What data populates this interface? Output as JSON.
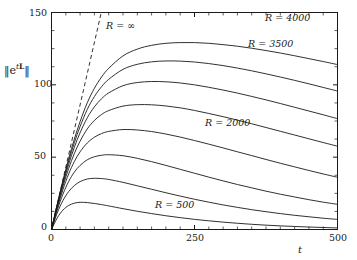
{
  "chart_data": {
    "type": "line",
    "title": "",
    "subtitle": "",
    "xlabel": "t",
    "ylabel_plain": "||e^{tL}||",
    "xlim": [
      0,
      500
    ],
    "ylim": [
      0,
      150
    ],
    "xticks": [
      0,
      250,
      500
    ],
    "xtick_labels": [
      "0",
      "250",
      "500"
    ],
    "yticks": [
      0,
      50,
      100,
      150
    ],
    "ytick_labels": [
      "0",
      "50",
      "100",
      "150"
    ],
    "x_minor_tick_step": 25,
    "y_minor_tick_step": 12.5,
    "grid": false,
    "legend_position": "inline-annotations",
    "x_sample": [
      0,
      10,
      20,
      30,
      40,
      50,
      62.5,
      75,
      87.5,
      100,
      125,
      150,
      175,
      200,
      225,
      250,
      275,
      300,
      325,
      350,
      375,
      400,
      425,
      450,
      475,
      500
    ],
    "series": [
      {
        "name": "R = 500",
        "label": "R = 500",
        "values": [
          0,
          8.0,
          13.4,
          16.6,
          18.2,
          18.8,
          18.6,
          18.0,
          17.2,
          16.3,
          14.4,
          12.6,
          11.0,
          9.5,
          8.2,
          7.0,
          6.0,
          5.1,
          4.3,
          3.6,
          3.0,
          2.5,
          2.1,
          1.7,
          1.4,
          1.1
        ]
      },
      {
        "name": "R = 1000",
        "label": "",
        "values": [
          0,
          11.4,
          20.0,
          26.2,
          30.4,
          33.1,
          34.9,
          35.4,
          35.2,
          34.6,
          32.6,
          30.2,
          27.8,
          25.4,
          23.1,
          20.9,
          18.9,
          17.0,
          15.3,
          13.7,
          12.3,
          11.0,
          9.8,
          8.8,
          7.8,
          7.0
        ]
      },
      {
        "name": "R = 1500",
        "label": "",
        "values": [
          0,
          13.4,
          24.4,
          33.2,
          39.7,
          44.3,
          48.2,
          50.3,
          51.3,
          51.7,
          51.0,
          49.2,
          46.9,
          44.3,
          41.6,
          38.9,
          36.2,
          33.6,
          31.1,
          28.8,
          26.5,
          24.4,
          22.5,
          20.6,
          18.9,
          17.4
        ]
      },
      {
        "name": "R = 2000",
        "label": "R = 2000",
        "values": [
          0,
          14.8,
          27.6,
          38.4,
          47.0,
          53.7,
          59.8,
          63.8,
          66.3,
          67.8,
          69.1,
          68.8,
          67.7,
          66.0,
          63.9,
          61.5,
          59.0,
          56.4,
          53.7,
          51.1,
          48.4,
          45.8,
          43.3,
          40.8,
          38.4,
          36.1
        ]
      },
      {
        "name": "R = 2500",
        "label": "",
        "values": [
          0,
          15.8,
          29.9,
          42.2,
          52.6,
          61.1,
          69.5,
          75.4,
          79.5,
          82.2,
          85.3,
          86.3,
          86.2,
          85.4,
          84.1,
          82.3,
          80.2,
          78.0,
          75.6,
          73.1,
          70.5,
          67.9,
          65.3,
          62.7,
          60.1,
          57.6
        ]
      },
      {
        "name": "R = 3000",
        "label": "",
        "values": [
          0,
          16.5,
          31.6,
          45.1,
          56.9,
          66.9,
          77.2,
          84.8,
          90.4,
          94.4,
          99.4,
          101.6,
          102.3,
          102.1,
          101.3,
          100.0,
          98.3,
          96.4,
          94.3,
          92.0,
          89.6,
          87.1,
          84.5,
          81.9,
          79.3,
          76.6
        ]
      },
      {
        "name": "R = 3500",
        "label": "R = 3500",
        "values": [
          0,
          17.1,
          32.9,
          47.3,
          60.1,
          71.2,
          83.0,
          91.9,
          98.7,
          103.8,
          110.7,
          114.2,
          115.9,
          116.5,
          116.4,
          115.8,
          114.7,
          113.3,
          111.6,
          109.7,
          107.6,
          105.4,
          103.1,
          100.7,
          98.2,
          95.7
        ]
      },
      {
        "name": "R = 4000",
        "label": "R = 4000",
        "values": [
          0,
          17.5,
          33.9,
          49.0,
          62.6,
          74.6,
          87.6,
          97.6,
          105.4,
          111.4,
          120.0,
          124.7,
          127.3,
          128.7,
          129.2,
          129.2,
          128.7,
          127.8,
          126.7,
          125.3,
          123.7,
          122.0,
          120.1,
          118.1,
          116.1,
          114.0
        ]
      }
    ],
    "asymptote": {
      "name": "R = infinity",
      "label": "R = ∞",
      "description": "dashed straight line through origin",
      "slope_units_per_t": 1.72,
      "x_range": [
        0,
        87
      ],
      "y_range": [
        0,
        150
      ]
    },
    "annotations": [
      {
        "text": "R = 4000",
        "x_px": 265,
        "y_px": 15
      },
      {
        "text": "R = 3500",
        "x_px": 248,
        "y_px": 38
      },
      {
        "text": "R = 2000",
        "x_px": 205,
        "y_px": 118
      },
      {
        "text": "R = 500",
        "x_px": 153,
        "y_px": 200
      },
      {
        "text": "R = ∞",
        "x_px": 104,
        "y_px": 20
      }
    ]
  },
  "axes": {
    "y_label_parts": {
      "bar_open": "‖",
      "e": "e",
      "t": "t",
      "L": "L",
      "bar_close": "‖"
    },
    "x_title": "t",
    "xtick_0": "0",
    "xtick_250": "250",
    "xtick_500": "500",
    "ytick_0": "0",
    "ytick_50": "50",
    "ytick_100": "100",
    "ytick_150": "150"
  },
  "labels": {
    "r4000": "R = 4000",
    "r3500": "R = 3500",
    "r2000": "R = 2000",
    "r500": "R = 500",
    "rinf": "R = ∞"
  },
  "colors": {
    "background": "#ffffff",
    "ink": "#1a1a1a",
    "curve": "#1a1a1a"
  }
}
